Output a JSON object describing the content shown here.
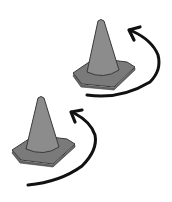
{
  "illustration": {
    "subject": "two traffic cones with curved rotation arrows",
    "colors": {
      "background": "#ffffff",
      "cone_fill": "#8c8c8c",
      "cone_base_fill": "#7a7a7a",
      "outline": "#3a3a3a",
      "arrow": "#111111"
    },
    "items": [
      {
        "name": "upper-cone",
        "icon": "traffic-cone-icon"
      },
      {
        "name": "upper-arrow",
        "icon": "curved-arrow-icon"
      },
      {
        "name": "lower-cone",
        "icon": "traffic-cone-icon"
      },
      {
        "name": "lower-arrow",
        "icon": "curved-arrow-icon"
      }
    ]
  }
}
